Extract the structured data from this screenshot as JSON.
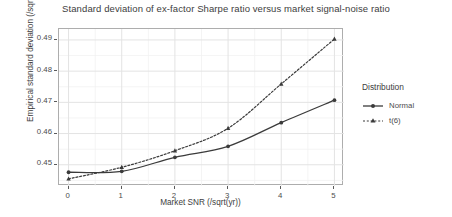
{
  "chart_data": {
    "type": "line",
    "title": "Standard deviation of ex-factor Sharpe ratio versus market signal-noise ratio",
    "xlabel": "Market SNR (/sqrt(yr))",
    "ylabel": "Empirical standard deviation (/sqrt(yr))",
    "x": [
      0,
      1,
      2,
      3,
      4,
      5
    ],
    "xlim": [
      -0.18,
      5.18
    ],
    "ylim": [
      0.4432,
      0.4935
    ],
    "xticks": [
      0,
      1,
      2,
      3,
      4,
      5
    ],
    "xtick_labels": [
      "0",
      "1",
      "2",
      "3",
      "4",
      "5"
    ],
    "yticks": [
      0.45,
      0.46,
      0.47,
      0.48,
      0.49
    ],
    "ytick_labels": [
      "0.45",
      "0.46",
      "0.47",
      "0.48",
      "0.49"
    ],
    "grid": true,
    "legend_position": "right",
    "legend_title": "Distribution",
    "series": [
      {
        "name": "Normal",
        "linestyle": "solid",
        "marker": "circle",
        "color": "#3b3b3b",
        "values": [
          0.4476,
          0.4479,
          0.4524,
          0.4559,
          0.4635,
          0.4707
        ]
      },
      {
        "name": "t(6)",
        "linestyle": "dotted",
        "marker": "triangle",
        "color": "#3b3b3b",
        "values": [
          0.4455,
          0.4492,
          0.4545,
          0.4617,
          0.4759,
          0.4903
        ]
      }
    ]
  },
  "colors": {
    "panel_border": "#adadad",
    "grid_major": "#e3e3e3",
    "grid_minor": "#f1f1f1",
    "text": "#4d4d4d",
    "ink": "#3b3b3b"
  }
}
